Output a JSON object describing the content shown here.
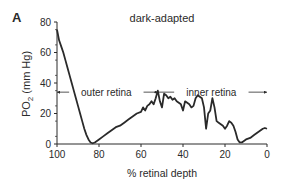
{
  "chart_data": {
    "type": "line",
    "panel_label": "A",
    "title": "dark-adapted",
    "xlabel": "% retinal depth",
    "ylabel_main": "PO",
    "ylabel_sub": "2",
    "ylabel_unit": " (mm Hg)",
    "xlim": [
      100,
      0
    ],
    "ylim": [
      0,
      80
    ],
    "xticks": [
      100,
      80,
      60,
      40,
      20,
      0
    ],
    "yticks": [
      0,
      20,
      40,
      60,
      80
    ],
    "grid": false,
    "annotations": [
      {
        "text": "outer retina",
        "x_from": 100,
        "x_to": 53,
        "y": 34
      },
      {
        "text": "inner retina",
        "x_from": 53,
        "x_to": 0,
        "y": 34
      }
    ],
    "series": [
      {
        "name": "PO2",
        "points": [
          [
            100,
            75
          ],
          [
            99,
            68
          ],
          [
            98,
            64
          ],
          [
            97,
            60
          ],
          [
            96,
            55
          ],
          [
            95,
            50
          ],
          [
            94,
            45
          ],
          [
            93,
            40
          ],
          [
            92,
            35
          ],
          [
            91,
            30
          ],
          [
            90,
            25
          ],
          [
            89,
            20
          ],
          [
            88,
            15
          ],
          [
            87,
            10
          ],
          [
            86,
            6
          ],
          [
            85,
            3
          ],
          [
            84,
            1
          ],
          [
            83,
            0.5
          ],
          [
            82,
            1
          ],
          [
            80,
            3
          ],
          [
            78,
            5
          ],
          [
            76,
            7
          ],
          [
            74,
            9
          ],
          [
            72,
            11
          ],
          [
            70,
            12
          ],
          [
            68,
            14
          ],
          [
            66,
            16
          ],
          [
            64,
            18
          ],
          [
            62,
            20
          ],
          [
            60,
            21
          ],
          [
            59,
            24
          ],
          [
            58,
            22
          ],
          [
            57,
            25
          ],
          [
            56,
            26
          ],
          [
            55,
            28
          ],
          [
            54,
            26
          ],
          [
            53,
            30
          ],
          [
            52,
            35
          ],
          [
            51,
            28
          ],
          [
            50,
            24
          ],
          [
            49,
            33
          ],
          [
            48,
            32
          ],
          [
            47,
            30
          ],
          [
            46,
            31
          ],
          [
            45,
            29
          ],
          [
            44,
            30
          ],
          [
            43,
            28
          ],
          [
            42,
            27
          ],
          [
            41,
            26
          ],
          [
            40,
            22
          ],
          [
            39,
            28
          ],
          [
            38,
            27
          ],
          [
            37,
            26
          ],
          [
            36,
            24
          ],
          [
            35,
            25
          ],
          [
            34,
            30
          ],
          [
            33,
            32
          ],
          [
            32,
            31
          ],
          [
            31,
            30
          ],
          [
            30,
            24
          ],
          [
            29,
            10
          ],
          [
            28,
            20
          ],
          [
            27,
            22
          ],
          [
            26,
            30
          ],
          [
            25,
            24
          ],
          [
            24,
            15
          ],
          [
            23,
            14
          ],
          [
            22,
            13
          ],
          [
            21,
            12
          ],
          [
            20,
            10
          ],
          [
            19,
            12
          ],
          [
            18,
            15
          ],
          [
            17,
            14
          ],
          [
            16,
            12
          ],
          [
            15,
            8
          ],
          [
            14,
            3
          ],
          [
            13,
            1
          ],
          [
            12,
            1
          ],
          [
            11,
            2
          ],
          [
            10,
            3
          ],
          [
            8,
            4
          ],
          [
            6,
            6
          ],
          [
            4,
            8
          ],
          [
            2,
            10
          ],
          [
            1,
            10.5
          ],
          [
            0,
            10
          ]
        ]
      }
    ]
  }
}
